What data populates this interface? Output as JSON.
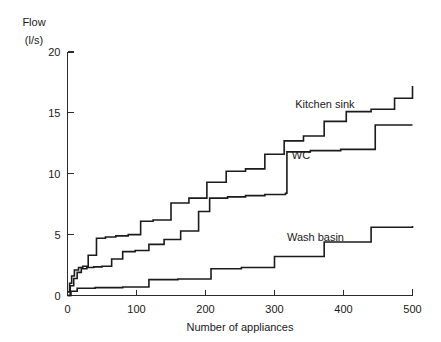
{
  "chart_data": {
    "type": "line",
    "variant": "step-post",
    "title": "",
    "subtitle": "",
    "xlabel": "Number of appliances",
    "ylabel": "Flow",
    "ylabel_units": "(l/s)",
    "xlim": [
      0,
      500
    ],
    "ylim": [
      0,
      20
    ],
    "xticks": [
      0,
      100,
      200,
      300,
      400,
      500
    ],
    "yticks": [
      0,
      5,
      10,
      15,
      20
    ],
    "xtick_labels": [
      "0",
      "100",
      "200",
      "300",
      "400",
      "500"
    ],
    "ytick_labels": [
      "0",
      "5",
      "10",
      "15",
      "20"
    ],
    "grid": false,
    "legend": "inline-annotations",
    "legend_position": "inline",
    "series": [
      {
        "name": "Kitchen sink",
        "label": "Kitchen sink",
        "color": "#1b1b1b",
        "annotation": {
          "x": 330,
          "y": 15.4
        },
        "x": [
          0,
          3,
          6,
          10,
          16,
          22,
          30,
          42,
          55,
          70,
          88,
          106,
          124,
          150,
          176,
          202,
          230,
          258,
          286,
          314,
          342,
          372,
          404,
          440,
          474,
          500
        ],
        "y": [
          0.3,
          1.0,
          1.6,
          2.1,
          2.3,
          2.4,
          3.3,
          4.7,
          4.8,
          4.9,
          5.0,
          6.1,
          6.2,
          7.6,
          8.0,
          9.3,
          10.2,
          10.4,
          11.6,
          12.7,
          13.1,
          14.3,
          15.1,
          15.3,
          16.2,
          17.2
        ]
      },
      {
        "name": "WC",
        "label": "WC",
        "color": "#1b1b1b",
        "annotation": {
          "x": 325,
          "y": 11.2
        },
        "x": [
          0,
          4,
          9,
          14,
          20,
          28,
          38,
          50,
          64,
          80,
          98,
          118,
          140,
          164,
          190,
          206,
          232,
          258,
          286,
          316,
          318,
          352,
          396,
          440,
          446,
          500
        ],
        "y": [
          0.0,
          0.8,
          1.4,
          1.9,
          2.2,
          2.3,
          2.35,
          2.4,
          3.0,
          3.6,
          3.7,
          4.2,
          4.6,
          5.3,
          6.9,
          8.0,
          8.1,
          8.2,
          8.3,
          8.4,
          11.8,
          11.9,
          12.0,
          12.0,
          14.0,
          14.0
        ]
      },
      {
        "name": "Wash basin",
        "label": "Wash basin",
        "color": "#1b1b1b",
        "annotation": {
          "x": 318,
          "y": 4.5
        },
        "x": [
          0,
          5,
          14,
          40,
          80,
          118,
          160,
          208,
          252,
          300,
          372,
          440,
          500
        ],
        "y": [
          0.0,
          0.35,
          0.6,
          0.65,
          0.7,
          1.3,
          1.35,
          2.2,
          2.3,
          3.2,
          4.4,
          5.6,
          5.7
        ]
      }
    ]
  },
  "axes": {
    "y_title_line1": "Flow",
    "y_title_line2": "(l/s)",
    "x_title": "Number of appliances"
  }
}
